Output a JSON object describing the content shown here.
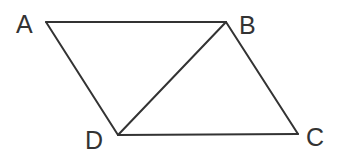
{
  "diagram": {
    "type": "parallelogram-with-diagonal",
    "stroke_color": "#333333",
    "background": "#ffffff",
    "vertices": {
      "A": {
        "label": "A",
        "x": 46,
        "y": 22,
        "label_x": 16,
        "label_y": 33
      },
      "B": {
        "label": "B",
        "x": 226,
        "y": 22,
        "label_x": 239,
        "label_y": 34
      },
      "C": {
        "label": "C",
        "x": 298,
        "y": 134,
        "label_x": 306,
        "label_y": 146
      },
      "D": {
        "label": "D",
        "x": 118,
        "y": 135,
        "label_x": 85,
        "label_y": 149
      }
    },
    "edges": [
      {
        "name": "AB",
        "from": "A",
        "to": "B"
      },
      {
        "name": "BC",
        "from": "B",
        "to": "C"
      },
      {
        "name": "CD",
        "from": "C",
        "to": "D"
      },
      {
        "name": "DA",
        "from": "D",
        "to": "A"
      },
      {
        "name": "BD",
        "from": "B",
        "to": "D",
        "kind": "diagonal"
      }
    ]
  }
}
